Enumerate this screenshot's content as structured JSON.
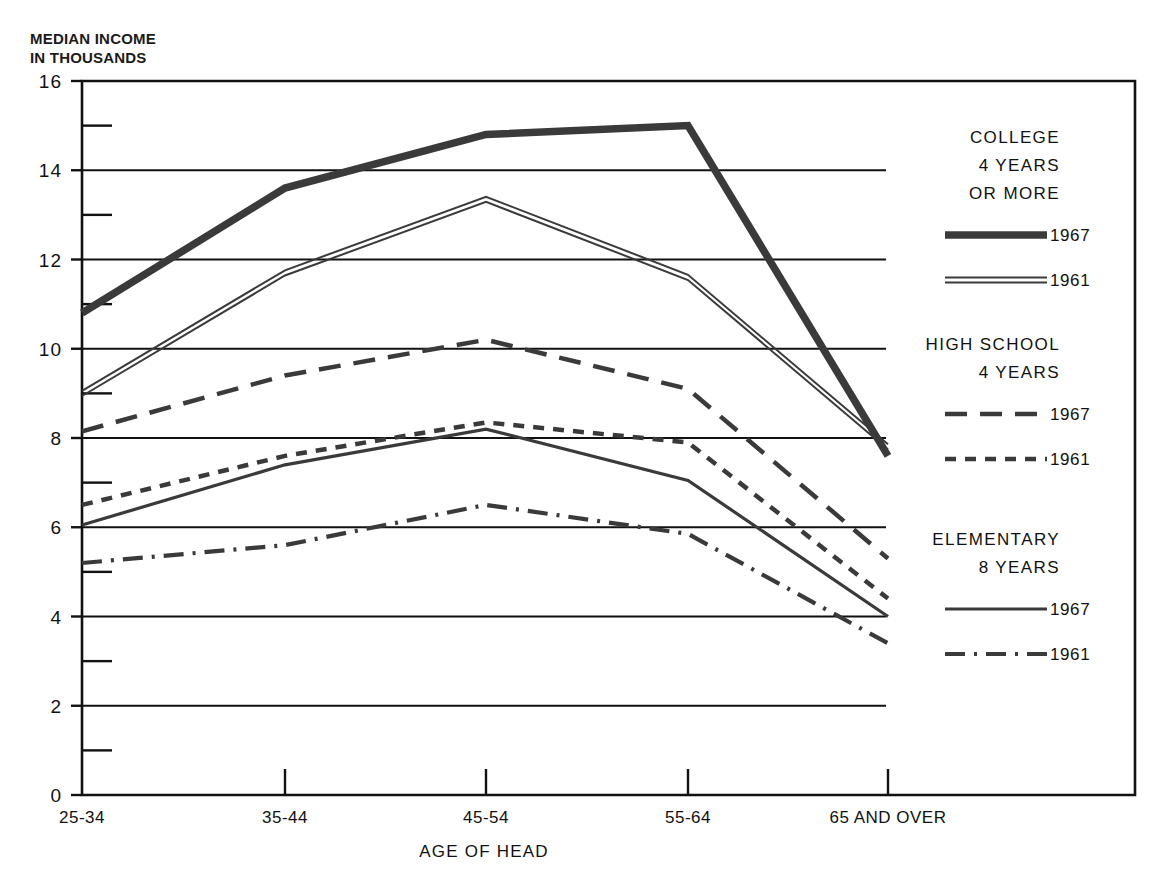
{
  "top_caption": "",
  "axis": {
    "y_title": "MEDIAN INCOME\nIN THOUSANDS",
    "x_title": "AGE OF HEAD",
    "y_ticks": [
      "0",
      "2",
      "4",
      "6",
      "8",
      "10",
      "12",
      "14",
      "16"
    ],
    "x_ticks": [
      "25-34",
      "35-44",
      "45-54",
      "55-64",
      "65 AND OVER"
    ]
  },
  "legend": {
    "groups": [
      {
        "title_lines": [
          "COLLEGE",
          "4 YEARS",
          "OR MORE"
        ],
        "entries": [
          {
            "label": "1967",
            "style": "thick-solid"
          },
          {
            "label": "1961",
            "style": "double-line"
          }
        ]
      },
      {
        "title_lines": [
          "HIGH SCHOOL",
          "4 YEARS"
        ],
        "entries": [
          {
            "label": "1967",
            "style": "long-dash"
          },
          {
            "label": "1961",
            "style": "short-dash"
          }
        ]
      },
      {
        "title_lines": [
          "ELEMENTARY",
          "8 YEARS"
        ],
        "entries": [
          {
            "label": "1967",
            "style": "thin-solid"
          },
          {
            "label": "1961",
            "style": "dash-dot"
          }
        ]
      }
    ]
  },
  "colors": {
    "ink": "#3a3a3a",
    "axis": "#111111",
    "grid": "#111111",
    "background": "#ffffff"
  },
  "chart_data": {
    "type": "line",
    "title": "",
    "xlabel": "AGE OF HEAD",
    "ylabel": "MEDIAN INCOME IN THOUSANDS",
    "categories": [
      "25-34",
      "35-44",
      "45-54",
      "55-64",
      "65 AND OVER"
    ],
    "ylim": [
      0,
      16
    ],
    "ytick_step": 2,
    "yminor_step": 1,
    "grid": "horizontal-major",
    "legend_position": "right-inside",
    "series": [
      {
        "name": "COLLEGE 4 YEARS OR MORE 1967",
        "group": "COLLEGE 4 YEARS OR MORE",
        "year": "1967",
        "style": "thick-solid",
        "values": [
          10.8,
          13.6,
          14.8,
          15.0,
          7.6
        ]
      },
      {
        "name": "COLLEGE 4 YEARS OR MORE 1961",
        "group": "COLLEGE 4 YEARS OR MORE",
        "year": "1961",
        "style": "double-line",
        "values": [
          9.0,
          11.7,
          13.35,
          11.6,
          7.8
        ]
      },
      {
        "name": "HIGH SCHOOL 4 YEARS 1967",
        "group": "HIGH SCHOOL 4 YEARS",
        "year": "1967",
        "style": "long-dash",
        "values": [
          8.15,
          9.4,
          10.2,
          9.1,
          5.3
        ]
      },
      {
        "name": "HIGH SCHOOL 4 YEARS 1961",
        "group": "HIGH SCHOOL 4 YEARS",
        "year": "1961",
        "style": "short-dash",
        "values": [
          6.5,
          7.6,
          8.35,
          7.9,
          4.4
        ]
      },
      {
        "name": "ELEMENTARY 8 YEARS 1967",
        "group": "ELEMENTARY 8 YEARS",
        "year": "1967",
        "style": "thin-solid",
        "values": [
          6.05,
          7.4,
          8.2,
          7.05,
          4.0
        ]
      },
      {
        "name": "ELEMENTARY 8 YEARS 1961",
        "group": "ELEMENTARY 8 YEARS",
        "year": "1961",
        "style": "dash-dot",
        "values": [
          5.2,
          5.6,
          6.5,
          5.85,
          3.4
        ]
      }
    ]
  }
}
